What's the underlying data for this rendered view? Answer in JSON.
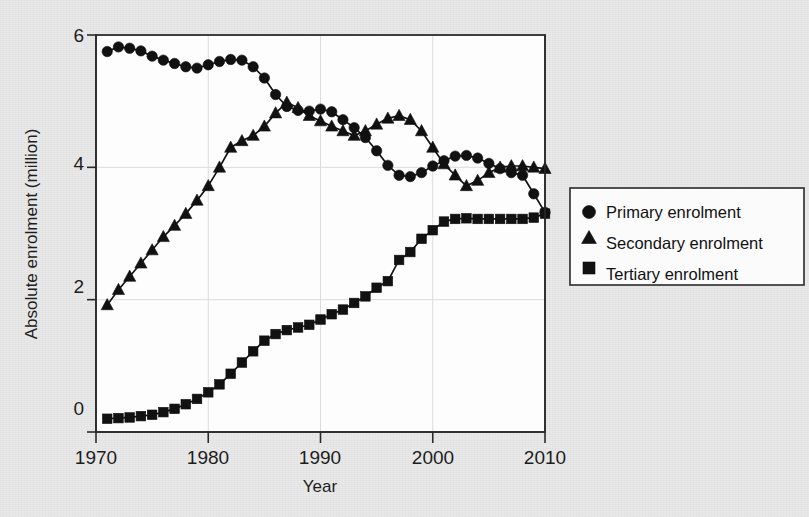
{
  "figure": {
    "background_color": "#e9e9e9",
    "plot_background_color": "#fdfdfd",
    "ink_color": "#121212"
  },
  "axes": {
    "x_title": "Year",
    "y_title": "Absolute enrolment (million)",
    "x_tick_labels": [
      "1970",
      "1980",
      "1990",
      "2000",
      "2010"
    ],
    "y_tick_labels": [
      "0",
      "2",
      "4",
      "6"
    ]
  },
  "legend": {
    "items": [
      {
        "marker": "circle-marker-icon",
        "label": "Primary enrolment"
      },
      {
        "marker": "triangle-marker-icon",
        "label": "Secondary enrolment"
      },
      {
        "marker": "square-marker-icon",
        "label": "Tertiary enrolment"
      }
    ]
  },
  "chart_data": {
    "type": "line",
    "title": "",
    "subtitle": "",
    "xlabel": "Year",
    "ylabel": "Absolute enrolment (million)",
    "xlim": [
      1970,
      2010
    ],
    "ylim": [
      0,
      6
    ],
    "xticks": [
      1970,
      1980,
      1990,
      2000,
      2010
    ],
    "yticks": [
      0,
      2,
      4,
      6
    ],
    "grid": true,
    "legend_position": "right-outside",
    "x": [
      1971,
      1972,
      1973,
      1974,
      1975,
      1976,
      1977,
      1978,
      1979,
      1980,
      1981,
      1982,
      1983,
      1984,
      1985,
      1986,
      1987,
      1988,
      1989,
      1990,
      1991,
      1992,
      1993,
      1994,
      1995,
      1996,
      1997,
      1998,
      1999,
      2000,
      2001,
      2002,
      2003,
      2004,
      2005,
      2006,
      2007,
      2008,
      2009,
      2010
    ],
    "series": [
      {
        "name": "Primary enrolment",
        "marker": "circle",
        "values": [
          5.75,
          5.82,
          5.8,
          5.76,
          5.68,
          5.62,
          5.57,
          5.52,
          5.5,
          5.55,
          5.6,
          5.63,
          5.62,
          5.52,
          5.35,
          5.1,
          4.92,
          4.86,
          4.85,
          4.88,
          4.84,
          4.72,
          4.6,
          4.45,
          4.25,
          4.03,
          3.88,
          3.86,
          3.92,
          4.02,
          4.1,
          4.17,
          4.18,
          4.14,
          4.06,
          3.98,
          3.92,
          3.88,
          3.6,
          3.32
        ]
      },
      {
        "name": "Secondary enrolment",
        "marker": "triangle",
        "values": [
          1.92,
          2.15,
          2.35,
          2.55,
          2.75,
          2.95,
          3.12,
          3.3,
          3.5,
          3.72,
          4.0,
          4.3,
          4.4,
          4.48,
          4.62,
          4.82,
          4.98,
          4.9,
          4.78,
          4.7,
          4.62,
          4.55,
          4.48,
          4.55,
          4.65,
          4.74,
          4.78,
          4.72,
          4.55,
          4.3,
          4.05,
          3.88,
          3.72,
          3.8,
          3.92,
          4.0,
          4.02,
          4.02,
          4.0,
          3.98
        ]
      },
      {
        "name": "Tertiary enrolment",
        "marker": "square",
        "values": [
          0.2,
          0.21,
          0.22,
          0.24,
          0.26,
          0.3,
          0.35,
          0.42,
          0.5,
          0.6,
          0.72,
          0.88,
          1.05,
          1.22,
          1.38,
          1.48,
          1.54,
          1.58,
          1.62,
          1.7,
          1.78,
          1.85,
          1.95,
          2.05,
          2.18,
          2.28,
          2.6,
          2.72,
          2.92,
          3.05,
          3.18,
          3.22,
          3.23,
          3.22,
          3.22,
          3.22,
          3.22,
          3.22,
          3.24,
          3.3
        ]
      }
    ]
  }
}
